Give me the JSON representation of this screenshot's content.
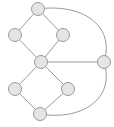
{
  "window": {
    "background": "#ffffff"
  },
  "diagram": {
    "type": "node-link-graph",
    "canvas": {
      "width": 114,
      "height": 127,
      "background": "#ffffff"
    },
    "style": {
      "node_fill": "#e5e5e5",
      "node_stroke": "#9a9a9a",
      "node_stroke_width": 1,
      "node_radius": 6.5,
      "edge_color": "#9a9a9a",
      "edge_width": 1
    },
    "nodes": [
      {
        "id": "top",
        "x": 38,
        "y": 9
      },
      {
        "id": "upper-left",
        "x": 15,
        "y": 35
      },
      {
        "id": "upper-right",
        "x": 63,
        "y": 35
      },
      {
        "id": "center",
        "x": 41,
        "y": 62
      },
      {
        "id": "right",
        "x": 104,
        "y": 62
      },
      {
        "id": "lower-left",
        "x": 15,
        "y": 89
      },
      {
        "id": "lower-right",
        "x": 68,
        "y": 89
      },
      {
        "id": "bottom",
        "x": 40,
        "y": 114
      }
    ],
    "edges": [
      {
        "from": "top",
        "to": "upper-left",
        "shape": "line"
      },
      {
        "from": "top",
        "to": "upper-right",
        "shape": "line"
      },
      {
        "from": "upper-left",
        "to": "center",
        "shape": "line"
      },
      {
        "from": "upper-right",
        "to": "center",
        "shape": "line"
      },
      {
        "from": "center",
        "to": "right",
        "shape": "line"
      },
      {
        "from": "center",
        "to": "lower-left",
        "shape": "line"
      },
      {
        "from": "center",
        "to": "lower-right",
        "shape": "line"
      },
      {
        "from": "lower-left",
        "to": "bottom",
        "shape": "line"
      },
      {
        "from": "lower-right",
        "to": "bottom",
        "shape": "line"
      },
      {
        "from": "top",
        "to": "right",
        "shape": "curve",
        "path": "M 38 9 C 80 3 116 24 104 62"
      },
      {
        "from": "bottom",
        "to": "right",
        "shape": "curve",
        "path": "M 40 114 C 80 121 116 100 104 62"
      }
    ]
  }
}
